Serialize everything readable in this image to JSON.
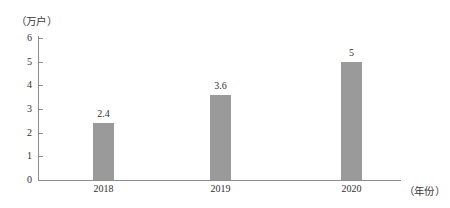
{
  "chart_data": {
    "type": "bar",
    "title": "",
    "subtitle": "",
    "xlabel": "（年份）",
    "ylabel": "（万户）",
    "categories": [
      "2018",
      "2019",
      "2020"
    ],
    "values": [
      2.4,
      3.6,
      5
    ],
    "value_labels": [
      "2.4",
      "3.6",
      "5"
    ],
    "ylim": [
      0,
      6
    ],
    "ytick_labels": [
      "0",
      "1",
      "2",
      "3",
      "4",
      "5",
      "6"
    ],
    "ytick_values": [
      0,
      1,
      2,
      3,
      4,
      5,
      6
    ],
    "grid": false,
    "legend": null,
    "series": [
      {
        "name": "",
        "values": [
          2.4,
          3.6,
          5
        ]
      }
    ],
    "annotations": []
  },
  "style": {
    "bar_color": "#9a9a9a",
    "axis_color": "#8d8d8d",
    "text_color": "#2f2f2f",
    "background": "#ffffff"
  }
}
